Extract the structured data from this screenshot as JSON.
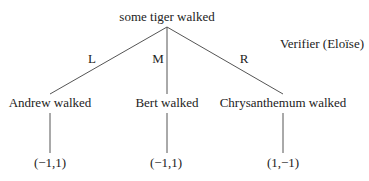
{
  "diagram": {
    "type": "game-tree",
    "root": {
      "label": "some tiger walked"
    },
    "player_label": "Verifier (Eloïse)",
    "branches": [
      {
        "move": "L",
        "node": "Andrew walked",
        "payoff": "(−1,1)"
      },
      {
        "move": "M",
        "node": "Bert walked",
        "payoff": "(−1,1)"
      },
      {
        "move": "R",
        "node": "Chrysanthemum walked",
        "payoff": "(1,−1)"
      }
    ]
  },
  "colors": {
    "text": "#222222",
    "lines": "#555555",
    "background": "#ffffff"
  }
}
